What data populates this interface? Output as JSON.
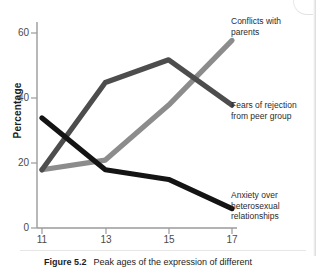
{
  "chart_data": {
    "type": "line",
    "title": "",
    "xlabel": "",
    "ylabel": "Percentage",
    "x": [
      11,
      13,
      15,
      17
    ],
    "categories": [
      "11",
      "13",
      "15",
      "17"
    ],
    "xtick_labels": [
      "11",
      "13",
      "15",
      "17"
    ],
    "ytick_labels": [
      "0",
      "20",
      "40",
      "60"
    ],
    "yticks": [
      0,
      20,
      40,
      60
    ],
    "ylim": [
      0,
      65
    ],
    "xlim": [
      11,
      17
    ],
    "grid": false,
    "legend_position": "annotations-right",
    "series": [
      {
        "name": "Conflicts with parents",
        "label": "Conflicts with\nparents",
        "color": "#8c8c8c",
        "values": [
          18,
          21,
          38,
          58
        ]
      },
      {
        "name": "Fears of rejection from peer group",
        "label": "Fears of rejection\nfrom peer group",
        "color": "#4d4d4d",
        "values": [
          18,
          45,
          52,
          38
        ]
      },
      {
        "name": "Anxiety over heterosexual relationships",
        "label": "Anxiety over\nheterosexual\nrelationships",
        "color": "#141414",
        "values": [
          34,
          18,
          15,
          6
        ]
      }
    ]
  },
  "caption": {
    "figure_number": "Figure 5.2",
    "text": "Peak ages of the expression of different"
  },
  "colors": {
    "axis": "#9a9a9a",
    "text": "#2b2b2b",
    "series_light_gray": "#8c8c8c",
    "series_dark_gray": "#4d4d4d",
    "series_black": "#141414"
  }
}
